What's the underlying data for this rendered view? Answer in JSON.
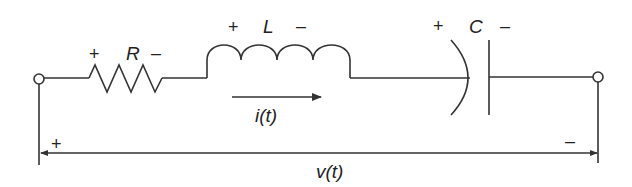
{
  "diagram": {
    "type": "series RLC circuit",
    "components": [
      {
        "id": "R",
        "label": "R",
        "kind": "resistor",
        "plus": "+",
        "minus": "–"
      },
      {
        "id": "L",
        "label": "L",
        "kind": "inductor",
        "plus": "+",
        "minus": "–"
      },
      {
        "id": "C",
        "label": "C",
        "kind": "capacitor",
        "plus": "+",
        "minus": "–"
      }
    ],
    "current": {
      "label": "i(t)",
      "direction": "left-to-right"
    },
    "voltage": {
      "label": "v(t)",
      "plus": "+",
      "minus": "–"
    },
    "terminals": [
      "left-terminal",
      "right-terminal"
    ],
    "colors": {
      "stroke": "#333333",
      "background": "#ffffff"
    }
  }
}
